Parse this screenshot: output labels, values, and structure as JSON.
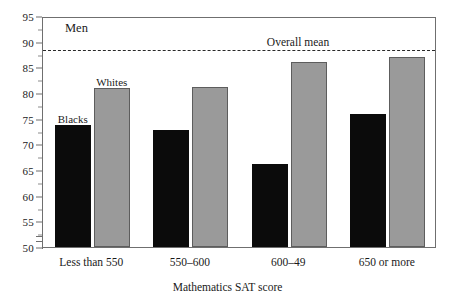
{
  "chart_data": {
    "type": "bar",
    "title": "",
    "panel_label": "Men",
    "xlabel": "Mathematics SAT score",
    "ylabel": "",
    "categories": [
      "Less than 550",
      "550–600",
      "600–49",
      "650 or more"
    ],
    "series": [
      {
        "name": "Blacks",
        "color": "#0b0b0b",
        "values": [
          73.8,
          72.7,
          66.2,
          76.0
        ]
      },
      {
        "name": "Whites",
        "color": "#9a9a9a",
        "values": [
          80.9,
          81.2,
          86.0,
          87.0
        ]
      }
    ],
    "ylim": [
      50,
      95
    ],
    "yticks": [
      50,
      55,
      60,
      65,
      70,
      75,
      80,
      85,
      90,
      95
    ],
    "ytick_labels": [
      "50",
      "55",
      "60",
      "65",
      "70",
      "75",
      "80",
      "85",
      "90",
      "95"
    ],
    "y_minor_ticks": [
      52.5,
      57.5,
      62.5,
      67.5,
      72.5,
      77.5,
      82.5,
      87.5,
      92.5
    ],
    "y_axis_break": true,
    "grid": false,
    "legend_position": "inline-annotation",
    "annotations": [
      {
        "name": "overall-mean",
        "label": "Overall mean",
        "value": 88.8,
        "style": "dashed-horizontal-line"
      },
      {
        "name": "blacks-annot",
        "label": "Blacks",
        "group": 0,
        "series": 0
      },
      {
        "name": "whites-annot",
        "label": "Whites",
        "group": 0,
        "series": 1
      }
    ]
  }
}
